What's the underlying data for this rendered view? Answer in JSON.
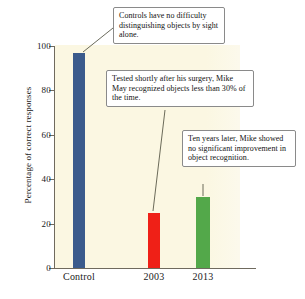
{
  "chart_data": {
    "type": "bar",
    "title": "",
    "xlabel": "",
    "ylabel": "Percentage of correct responses",
    "categories": [
      "Control",
      "2003",
      "2013"
    ],
    "values": [
      97,
      25,
      32
    ],
    "ylim": [
      0,
      100
    ],
    "yticks": [
      0,
      20,
      40,
      60,
      80,
      100
    ],
    "ytick_labels": [
      "0",
      "20",
      "40",
      "60",
      "80",
      "100"
    ],
    "grid": false,
    "legend": false,
    "bar_colors": [
      "#3b5b8c",
      "#ef2017",
      "#53a84a"
    ],
    "plot_background": "#fbf7e2",
    "annotations": [
      {
        "id": "annotation-control",
        "text": "Controls have no difficulty distinguishing objects by sight alone.",
        "points_to": "Control"
      },
      {
        "id": "annotation-2003",
        "text": "Tested shortly after his surgery, Mike May recognized objects less than 30% of the time.",
        "points_to": "2003"
      },
      {
        "id": "annotation-2013",
        "text": "Ten years later, Mike showed no significant improvement in object recognition.",
        "points_to": "2013"
      }
    ]
  }
}
